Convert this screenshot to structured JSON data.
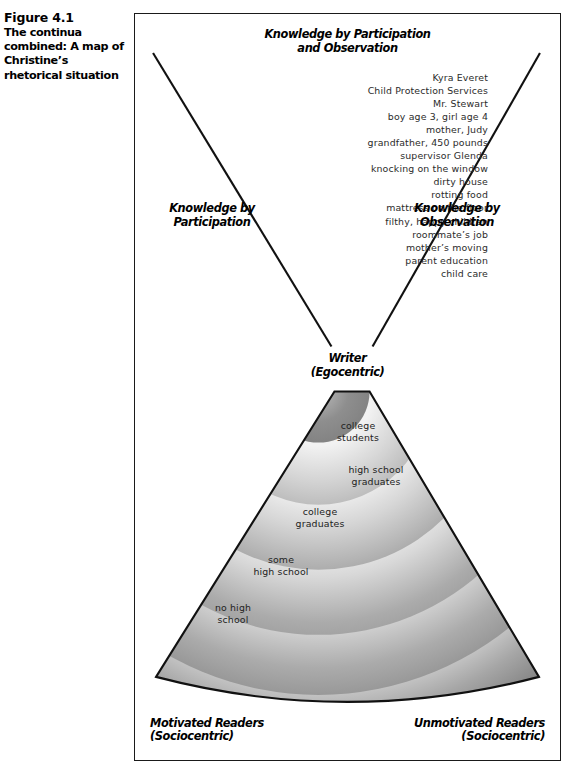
{
  "caption": {
    "number": "Figure 4.1",
    "text": "The continua combined: A map of Christine’s rhetorical situation"
  },
  "figure": {
    "top_label": [
      "Knowledge by Participation",
      "and Observation"
    ],
    "left_axis_label": [
      "Knowledge by",
      "Participation"
    ],
    "right_axis_label": [
      "Knowledge by",
      "Observation"
    ],
    "apex_label": [
      "Writer",
      "(Egocentric)"
    ],
    "bottom_left_label": [
      "Motivated Readers",
      "(Sociocentric)"
    ],
    "bottom_right_label": [
      "Unmotivated Readers",
      "(Sociocentric)"
    ],
    "items": [
      "Kyra Everet",
      "Child Protection Services",
      "Mr. Stewart",
      "boy age 3, girl age 4",
      "mother, Judy",
      "grandfather, 450 pounds",
      "supervisor Glenda",
      "knocking on the window",
      "dirty house",
      "rotting food",
      "mattress on the floor",
      "filthy, happy children",
      "roommate’s job",
      "mother’s moving",
      "parent education",
      "child care"
    ],
    "bands": [
      {
        "lines": [
          "college",
          "students"
        ]
      },
      {
        "lines": [
          "high school",
          "graduates"
        ]
      },
      {
        "lines": [
          "college",
          "graduates"
        ]
      },
      {
        "lines": [
          "some",
          "high school"
        ]
      },
      {
        "lines": [
          "no high",
          "school"
        ]
      }
    ],
    "colors": {
      "frame": "#1a1a1a",
      "line": "#111111",
      "band_dark": "#5f5f5f",
      "band_mid": "#8c8c8c",
      "band_light": "#e8e8e8",
      "text": "#000000"
    }
  }
}
